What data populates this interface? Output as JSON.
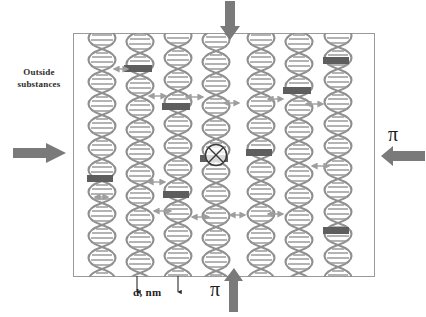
{
  "figure": {
    "background_color": "#ffffff",
    "arrow_color": "#7a7a7a",
    "box_border_color": "#9a9a9a",
    "helix_color": "#8c8c8c",
    "helix_band_color": "#5a5a5a",
    "text_color": "#1d1d1d"
  },
  "labels": {
    "outside_substances": "Outside\nsubstances",
    "outside_line1": "Outside",
    "outside_line2": "substances",
    "dimension": "d, nm",
    "pi_right": "π",
    "pi_bottom": "π"
  },
  "membrane": {
    "x": 73,
    "y": 33,
    "width": 302,
    "height": 244,
    "helix_count": 7,
    "helix_columns_x": [
      100,
      138,
      176,
      214,
      259,
      297,
      336
    ],
    "helix_height": 250
  },
  "big_arrows": [
    {
      "name": "top-inflow-arrow",
      "direction": "down",
      "x": 228,
      "y": 2,
      "length": 38,
      "label": ""
    },
    {
      "name": "left-inflow-arrow",
      "direction": "right",
      "x": 14,
      "y": 145,
      "length": 52,
      "label": ""
    },
    {
      "name": "right-inflow-arrow",
      "direction": "left",
      "x": 382,
      "y": 147,
      "length": 44,
      "label": "π"
    },
    {
      "name": "bottom-inflow-arrow",
      "direction": "up",
      "x": 231,
      "y": 272,
      "length": 40,
      "label": "π"
    }
  ],
  "mini_arrows": [
    {
      "x": 112,
      "y": 68,
      "width": 16
    },
    {
      "x": 147,
      "y": 95,
      "width": 18
    },
    {
      "x": 184,
      "y": 96,
      "width": 18
    },
    {
      "x": 222,
      "y": 102,
      "width": 16
    },
    {
      "x": 266,
      "y": 98,
      "width": 16
    },
    {
      "x": 304,
      "y": 103,
      "width": 18
    },
    {
      "x": 146,
      "y": 181,
      "width": 18
    },
    {
      "x": 152,
      "y": 210,
      "width": 18
    },
    {
      "x": 190,
      "y": 216,
      "width": 18
    },
    {
      "x": 228,
      "y": 214,
      "width": 16
    },
    {
      "x": 266,
      "y": 213,
      "width": 16
    },
    {
      "x": 310,
      "y": 165,
      "width": 18
    },
    {
      "x": 93,
      "y": 196,
      "width": 14
    }
  ],
  "dimension_ticks": [
    {
      "x": 137,
      "y_top": 277,
      "y_bottom": 295
    },
    {
      "x": 178,
      "y_top": 277,
      "y_bottom": 295
    }
  ],
  "cross_mark": {
    "name": "blocked-transport-symbol",
    "glyph": "⊗",
    "x": 203,
    "y": 142,
    "radius": 11
  }
}
